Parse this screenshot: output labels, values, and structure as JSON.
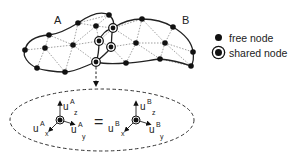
{
  "diagram": {
    "region_a_label": "A",
    "region_b_label": "B",
    "equals_sign": "=",
    "node_a": {
      "base": "u",
      "superscript": "A",
      "components": {
        "z": "z",
        "x": "x",
        "y": "y"
      }
    },
    "node_b": {
      "base": "u",
      "superscript": "B",
      "components": {
        "z": "z",
        "x": "x",
        "y": "y"
      }
    }
  },
  "legend": {
    "items": [
      {
        "label": "free node",
        "symbol": "free-node-dot"
      },
      {
        "label": "shared node",
        "symbol": "shared-node-ringed-dot"
      }
    ]
  },
  "colors": {
    "ink": "#111111",
    "mesh_line": "#777777",
    "background": "#ffffff"
  }
}
